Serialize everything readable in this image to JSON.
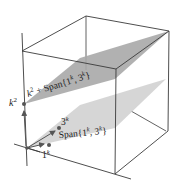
{
  "diagram": {
    "type": "3d-subspace-illustration",
    "colors": {
      "edge": "#3a3a3a",
      "upper_plane": "#a9a9a9",
      "lower_plane": "#d2d2d2",
      "point": "#555555",
      "background": "#ffffff"
    },
    "labels": {
      "k2_point": {
        "base": "k",
        "sup": "2"
      },
      "upper_plane": {
        "prefix_base": "k",
        "prefix_sup": "2",
        "text": " + Span{1",
        "sup1": "k",
        "mid": ", 3",
        "sup2": "k",
        "suffix": "}"
      },
      "lower_plane": {
        "text": "Span{1",
        "sup1": "k",
        "mid": ", 3",
        "sup2": "k",
        "suffix": "}"
      },
      "vector_3k": {
        "base": "3",
        "sup": "k"
      },
      "vector_1k": {
        "base": "1",
        "sup": "k"
      }
    }
  }
}
